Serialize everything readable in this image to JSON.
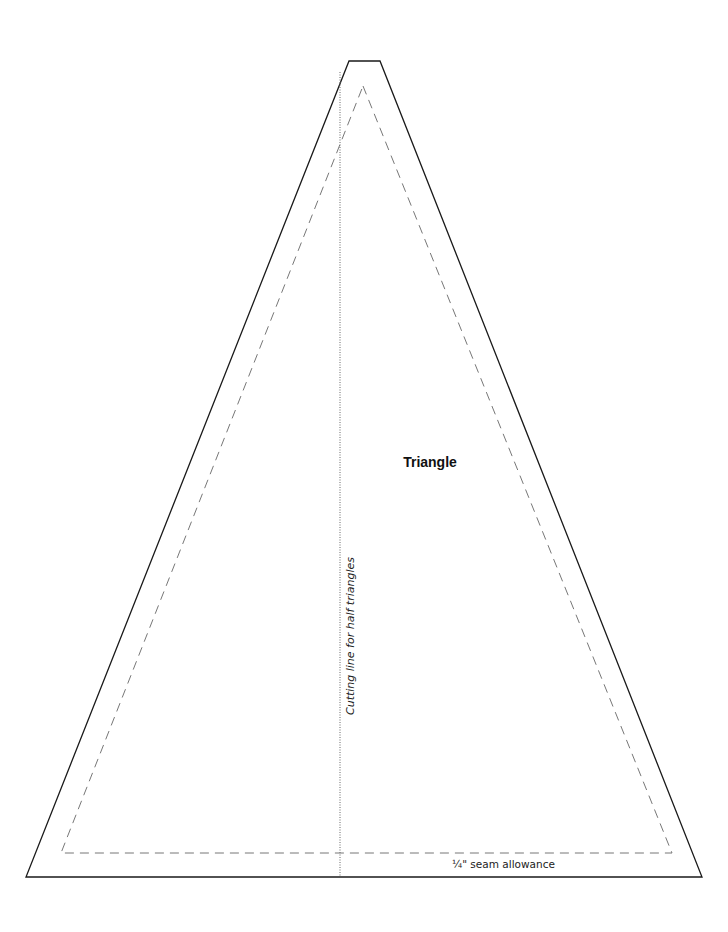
{
  "pattern": {
    "shape_label": "Triangle",
    "cutting_line_label": "Cutting line for half triangles",
    "seam_allowance_label": "¼\" seam allowance"
  },
  "geometry": {
    "outer_outline": [
      [
        349,
        61
      ],
      [
        380,
        61
      ],
      [
        702,
        877
      ],
      [
        26,
        877
      ]
    ],
    "inner_seam_line": [
      [
        363,
        86
      ],
      [
        672,
        853
      ],
      [
        61,
        853
      ]
    ],
    "cutting_line": [
      [
        340,
        72
      ],
      [
        340,
        877
      ]
    ]
  },
  "colors": {
    "outline": "#1a1a1a",
    "seam_dash": "#777777",
    "cut_line": "#666666",
    "background": "#ffffff"
  }
}
